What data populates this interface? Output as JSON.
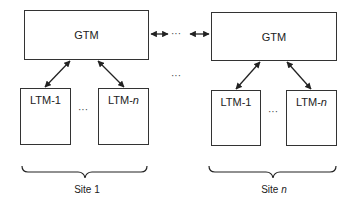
{
  "diagram": {
    "sites": [
      {
        "gtm_label": "GTM",
        "ltms": [
          {
            "prefix": "LTM-",
            "suffix": "1",
            "suffix_italic": false
          },
          {
            "prefix": "LTM-",
            "suffix": "n",
            "suffix_italic": true
          }
        ],
        "ltm_ellipsis": "···",
        "site_prefix": "Site ",
        "site_suffix": "1",
        "site_suffix_italic": false
      },
      {
        "gtm_label": "GTM",
        "ltms": [
          {
            "prefix": "LTM-",
            "suffix": "1",
            "suffix_italic": false
          },
          {
            "prefix": "LTM-",
            "suffix": "n",
            "suffix_italic": true
          }
        ],
        "ltm_ellipsis": "···",
        "site_prefix": "Site ",
        "site_suffix": "n",
        "site_suffix_italic": true
      }
    ],
    "gtm_link_ellipsis": "···",
    "between_sites_ellipsis": "···",
    "colors": {
      "line": "#333333",
      "background": "#ffffff"
    }
  }
}
